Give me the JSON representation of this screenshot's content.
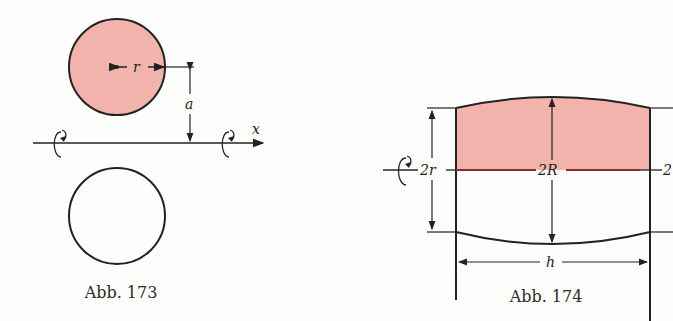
{
  "figures": [
    {
      "id": "fig173",
      "caption": "Abb. 173",
      "labels": {
        "radius": "r",
        "distance": "a",
        "axis": "x"
      },
      "fill_color": "#f2b3ac",
      "stroke_color": "#222222"
    },
    {
      "id": "fig174",
      "caption": "Abb. 174",
      "labels": {
        "small_diameter": "2r",
        "large_diameter": "2R",
        "height": "h",
        "right_diameter": "2"
      },
      "fill_color": "#f2b3ac",
      "midline_color": "#8b2a22",
      "stroke_color": "#222222"
    }
  ]
}
